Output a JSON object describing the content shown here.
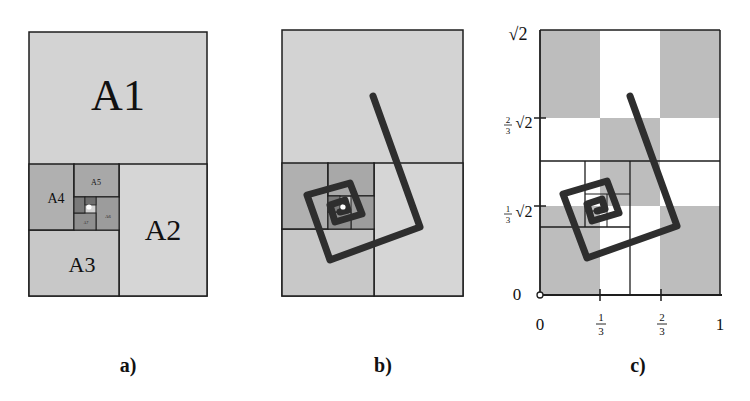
{
  "colors": {
    "light": "#d3d3d3",
    "mid": "#b5b5b5",
    "dark": "#8f8f8f",
    "darker": "#7a7a7a",
    "line": "#1e1e1e",
    "spiral": "#2e2e2e",
    "checker": "#bdbdbd"
  },
  "panel_a": {
    "caption": "a)",
    "regions": [
      "A1",
      "A2",
      "A3",
      "A4",
      "A5",
      "A6",
      "A7"
    ]
  },
  "panel_b": {
    "caption": "b)"
  },
  "panel_c": {
    "caption": "c)",
    "x_ticks": [
      "0",
      "1",
      "3",
      "2",
      "3",
      "1"
    ],
    "x_tick_labels": [
      "0",
      "1/3",
      "2/3",
      "1"
    ],
    "y_tick_labels": [
      "0",
      "1/3 √2",
      "2/3 √2",
      "√2"
    ],
    "y_sqrt": "√2",
    "y_zero": "0",
    "x_zero": "0",
    "x_one": "1",
    "frac_1": "1",
    "frac_2": "2",
    "frac_den": "3"
  }
}
